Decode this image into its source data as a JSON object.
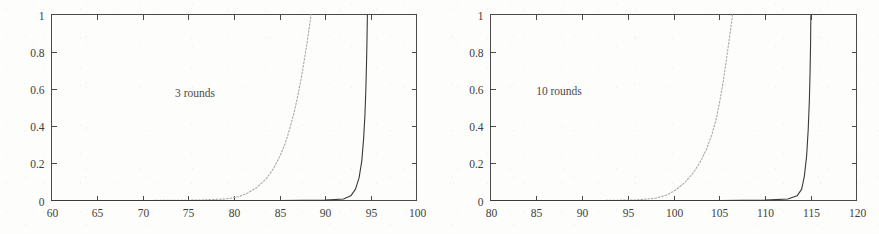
{
  "figure": {
    "background_color": "#fdfdfb",
    "axis_color": "#4a4a4a",
    "solid_curve_color": "#3a3a3a",
    "dotted_curve_color": "#a8a8a8"
  },
  "chart_data": [
    {
      "type": "line",
      "title": "",
      "annotation": "3 rounds",
      "xlabel": "",
      "ylabel": "",
      "xlim": [
        60,
        100
      ],
      "ylim": [
        0,
        1
      ],
      "xticks": [
        60,
        65,
        70,
        75,
        80,
        85,
        90,
        95,
        100
      ],
      "xticklabels": [
        "60",
        "65",
        "70",
        "75",
        "80",
        "85",
        "90",
        "95",
        "100"
      ],
      "yticks": [
        0,
        0.2,
        0.4,
        0.6,
        0.8,
        1
      ],
      "yticklabels": [
        "0",
        "0.2",
        "0.4",
        "0.6",
        "0.8",
        "1"
      ],
      "grid": false,
      "legend": "none",
      "series": [
        {
          "name": "dotted",
          "style": "dotted",
          "color": "#a8a8a8",
          "x": [
            60,
            70,
            76,
            79,
            80.5,
            81.5,
            82.5,
            83.5,
            84.3,
            85.0,
            85.6,
            86.1,
            86.6,
            87.0,
            87.4,
            87.7,
            88.0,
            88.2,
            88.35,
            88.45
          ],
          "y": [
            0,
            0,
            0.002,
            0.008,
            0.02,
            0.04,
            0.07,
            0.115,
            0.17,
            0.235,
            0.305,
            0.385,
            0.475,
            0.565,
            0.665,
            0.755,
            0.845,
            0.915,
            0.965,
            1.0
          ]
        },
        {
          "name": "solid",
          "style": "solid",
          "color": "#3a3a3a",
          "x": [
            60,
            85,
            90,
            92.0,
            92.8,
            93.3,
            93.7,
            94.0,
            94.2,
            94.35,
            94.45,
            94.52,
            94.57,
            94.6,
            94.62
          ],
          "y": [
            0,
            0,
            0.002,
            0.008,
            0.025,
            0.06,
            0.12,
            0.21,
            0.33,
            0.46,
            0.6,
            0.73,
            0.85,
            0.94,
            1.0
          ]
        }
      ]
    },
    {
      "type": "line",
      "title": "",
      "annotation": "10 rounds",
      "xlabel": "",
      "ylabel": "",
      "xlim": [
        80,
        120
      ],
      "ylim": [
        0,
        1
      ],
      "xticks": [
        80,
        85,
        90,
        95,
        100,
        105,
        110,
        115,
        120
      ],
      "xticklabels": [
        "80",
        "85",
        "90",
        "95",
        "100",
        "105",
        "110",
        "115",
        "120"
      ],
      "yticks": [
        0,
        0.2,
        0.4,
        0.6,
        0.8,
        1
      ],
      "yticklabels": [
        "0",
        "0.2",
        "0.4",
        "0.6",
        "0.8",
        "1"
      ],
      "grid": false,
      "legend": "none",
      "series": [
        {
          "name": "dotted",
          "style": "dotted",
          "color": "#a8a8a8",
          "x": [
            80,
            92,
            96,
            98,
            99.2,
            100.2,
            101.2,
            102.1,
            102.9,
            103.6,
            104.2,
            104.7,
            105.1,
            105.45,
            105.75,
            106.0,
            106.2,
            106.35,
            106.45
          ],
          "y": [
            0,
            0,
            0.003,
            0.012,
            0.028,
            0.055,
            0.095,
            0.145,
            0.205,
            0.275,
            0.355,
            0.445,
            0.545,
            0.645,
            0.745,
            0.835,
            0.905,
            0.96,
            1.0
          ]
        },
        {
          "name": "solid",
          "style": "solid",
          "color": "#3a3a3a",
          "x": [
            80,
            105,
            110,
            112.5,
            113.5,
            114.0,
            114.3,
            114.55,
            114.72,
            114.85,
            114.93,
            114.98,
            115.0,
            115.02
          ],
          "y": [
            0,
            0,
            0.002,
            0.008,
            0.025,
            0.06,
            0.13,
            0.24,
            0.38,
            0.54,
            0.7,
            0.84,
            0.94,
            1.0
          ]
        }
      ]
    }
  ]
}
